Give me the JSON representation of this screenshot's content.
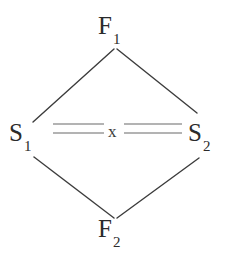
{
  "figure": {
    "type": "lattice-diagram",
    "background_color": "#ffffff",
    "nodes": [
      {
        "id": "f1",
        "base": "F",
        "subscript": "1",
        "label": "F1",
        "position": "top",
        "x": 115,
        "y": 26,
        "color": "#2b2b2b"
      },
      {
        "id": "s1",
        "base": "S",
        "subscript": "1",
        "label": "S1",
        "position": "left",
        "x": 22,
        "y": 133,
        "color": "#2b2b2b"
      },
      {
        "id": "s2",
        "base": "S",
        "subscript": "2",
        "label": "S2",
        "position": "right",
        "x": 199,
        "y": 133,
        "color": "#2b2b2b"
      },
      {
        "id": "f2",
        "base": "F",
        "subscript": "2",
        "label": "F2",
        "position": "bottom",
        "x": 115,
        "y": 229,
        "color": "#2b2b2b"
      }
    ],
    "edges": [
      {
        "id": "e-f1-s1",
        "from": "f1",
        "to": "s1",
        "style": "single",
        "color": "#3c3c3c",
        "x1": 114,
        "y1": 49,
        "x2": 33,
        "y2": 122
      },
      {
        "id": "e-f1-s2",
        "from": "f1",
        "to": "s2",
        "style": "single",
        "color": "#3c3c3c",
        "x1": 117,
        "y1": 49,
        "x2": 197,
        "y2": 113
      },
      {
        "id": "e-s1-f2",
        "from": "s1",
        "to": "f2",
        "style": "single",
        "color": "#3c3c3c",
        "x1": 34,
        "y1": 157,
        "x2": 114,
        "y2": 218
      },
      {
        "id": "e-s2-f2",
        "from": "s2",
        "to": "f2",
        "style": "single",
        "color": "#3c3c3c",
        "x1": 117,
        "y1": 218,
        "x2": 199,
        "y2": 158
      },
      {
        "id": "e-s1-s2",
        "from": "s1",
        "to": "s2",
        "style": "double",
        "color": "#9a9a9a",
        "x1": 53,
        "y1": 128,
        "x2": 182,
        "y2": 128,
        "gap": 9,
        "label": "x"
      }
    ],
    "cross_label": "x"
  }
}
